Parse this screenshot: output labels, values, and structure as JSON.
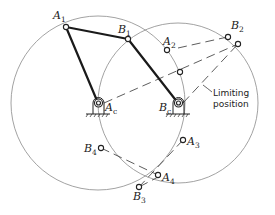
{
  "figure": {
    "type": "four-bar linkage limiting positions diagram",
    "circles": [
      {
        "name": "crank-circle",
        "center": "A_c",
        "cx": 98,
        "cy": 103,
        "r": 87
      },
      {
        "name": "rocker-circle",
        "center": "B_c",
        "cx": 178,
        "cy": 103,
        "r": 80
      }
    ],
    "labels": {
      "A1": {
        "base": "A",
        "sub": "1"
      },
      "B1": {
        "base": "B",
        "sub": "1"
      },
      "A2": {
        "base": "A",
        "sub": "2"
      },
      "B2": {
        "base": "B",
        "sub": "2"
      },
      "A3": {
        "base": "A",
        "sub": "3"
      },
      "B3": {
        "base": "B",
        "sub": "3"
      },
      "A4": {
        "base": "A",
        "sub": "4"
      },
      "B4": {
        "base": "B",
        "sub": "4"
      },
      "Ac": {
        "base": "A",
        "sub": "c"
      },
      "Bc": {
        "base": "B",
        "sub": "c"
      }
    },
    "annotation": {
      "line1": "Limiting",
      "line2": "position"
    }
  }
}
